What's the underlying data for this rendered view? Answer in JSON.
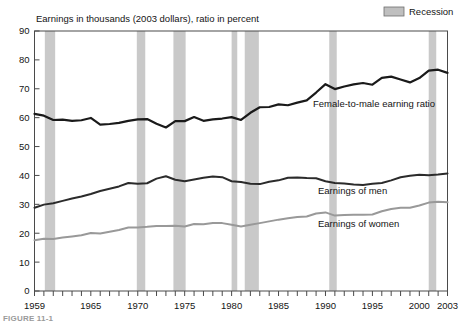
{
  "header": {
    "axis_title": "Earnings in thousands (2003 dollars), ratio in percent"
  },
  "legend": {
    "recession_label": "Recession",
    "recession_color": "#bfbfbf"
  },
  "annotations": {
    "ratio_label": "Female-to-male earning ratio",
    "men_label": "Earnings of men",
    "women_label": "Earnings of women"
  },
  "caption": {
    "text": "FIGURE 11-1"
  },
  "chart_data": {
    "type": "line",
    "title": "",
    "subtitle": "",
    "xlabel": "",
    "ylabel": "Earnings in thousands (2003 dollars), ratio in percent",
    "xlim": [
      1959,
      2003
    ],
    "ylim": [
      0,
      90
    ],
    "ytick_step": 10,
    "yticks": [
      0,
      10,
      20,
      30,
      40,
      50,
      60,
      70,
      80,
      90
    ],
    "xticks_labeled": [
      1959,
      1965,
      1970,
      1975,
      1980,
      1985,
      1990,
      1995,
      2000,
      2003
    ],
    "xtick_minor_every": 1,
    "grid": false,
    "legend_position": "top-right",
    "x": [
      1959,
      1960,
      1961,
      1962,
      1963,
      1964,
      1965,
      1966,
      1967,
      1968,
      1969,
      1970,
      1971,
      1972,
      1973,
      1974,
      1975,
      1976,
      1977,
      1978,
      1979,
      1980,
      1981,
      1982,
      1983,
      1984,
      1985,
      1986,
      1987,
      1988,
      1989,
      1990,
      1991,
      1992,
      1993,
      1994,
      1995,
      1996,
      1997,
      1998,
      1999,
      2000,
      2001,
      2002,
      2003
    ],
    "series": [
      {
        "name": "Female-to-male earning ratio",
        "unit": "percent",
        "color": "#1a1a1a",
        "width": 2.2,
        "values": [
          61.3,
          60.7,
          59.2,
          59.3,
          58.9,
          59.1,
          59.9,
          57.6,
          57.8,
          58.2,
          58.9,
          59.4,
          59.5,
          57.9,
          56.6,
          58.8,
          58.8,
          60.2,
          58.9,
          59.4,
          59.7,
          60.2,
          59.2,
          61.7,
          63.6,
          63.7,
          64.6,
          64.3,
          65.2,
          66.0,
          68.7,
          71.6,
          69.9,
          70.8,
          71.5,
          72.0,
          71.4,
          73.8,
          74.2,
          73.2,
          72.2,
          73.7,
          76.3,
          76.6,
          75.5
        ]
      },
      {
        "name": "Earnings of men",
        "unit": "thousands of 2003 dollars",
        "color": "#2b2b2b",
        "width": 2.0,
        "values": [
          28.8,
          29.9,
          30.4,
          31.2,
          32.0,
          32.7,
          33.6,
          34.6,
          35.4,
          36.2,
          37.4,
          37.1,
          37.3,
          38.9,
          39.7,
          38.5,
          38.0,
          38.6,
          39.2,
          39.6,
          39.4,
          38.0,
          37.7,
          37.1,
          37.0,
          37.8,
          38.3,
          39.2,
          39.3,
          39.1,
          39.0,
          38.0,
          37.4,
          37.2,
          36.9,
          36.7,
          37.1,
          37.4,
          38.3,
          39.4,
          39.9,
          40.2,
          40.1,
          40.3,
          40.7
        ]
      },
      {
        "name": "Earnings of women",
        "unit": "thousands of 2003 dollars",
        "color": "#999999",
        "width": 2.0,
        "values": [
          17.6,
          18.1,
          18.0,
          18.5,
          18.9,
          19.3,
          20.1,
          19.9,
          20.5,
          21.1,
          22.0,
          22.0,
          22.2,
          22.5,
          22.5,
          22.6,
          22.3,
          23.2,
          23.1,
          23.5,
          23.5,
          22.9,
          22.3,
          22.9,
          23.5,
          24.1,
          24.7,
          25.2,
          25.6,
          25.8,
          26.8,
          27.2,
          26.1,
          26.3,
          26.4,
          26.4,
          26.5,
          27.6,
          28.4,
          28.8,
          28.8,
          29.6,
          30.6,
          30.9,
          30.7
        ]
      }
    ],
    "recession_bands": [
      {
        "start": 1960.1,
        "end": 1961.2
      },
      {
        "start": 1969.9,
        "end": 1970.8
      },
      {
        "start": 1973.8,
        "end": 1975.1
      },
      {
        "start": 1980.0,
        "end": 1980.6
      },
      {
        "start": 1981.4,
        "end": 1982.9
      },
      {
        "start": 1990.4,
        "end": 1991.2
      },
      {
        "start": 2001.0,
        "end": 2001.8
      }
    ]
  }
}
